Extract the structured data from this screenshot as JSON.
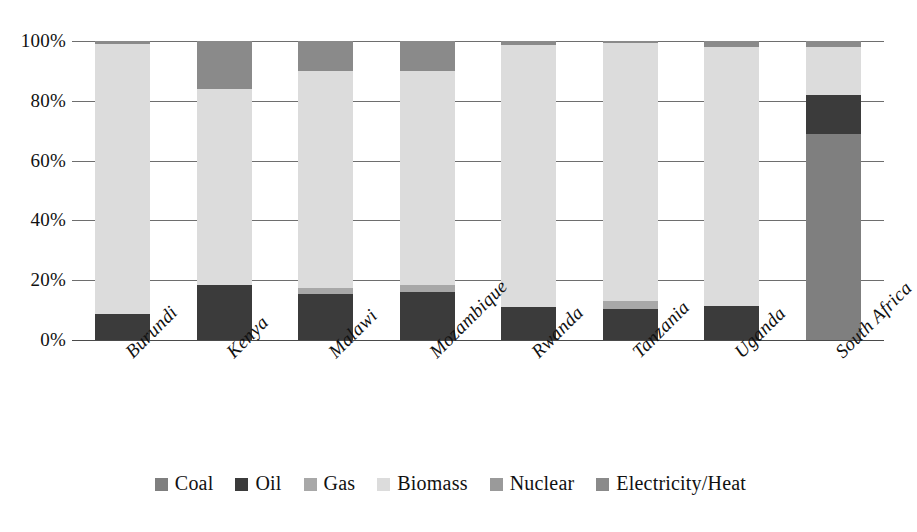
{
  "chart_data": {
    "type": "bar",
    "stacked": true,
    "stack_mode": "percent",
    "title": "",
    "xlabel": "",
    "ylabel": "",
    "ylim": [
      0,
      100
    ],
    "ytick_labels": [
      "0%",
      "20%",
      "40%",
      "60%",
      "80%",
      "100%"
    ],
    "ytick_values": [
      0,
      20,
      40,
      60,
      80,
      100
    ],
    "grid": true,
    "legend_position": "bottom",
    "categories": [
      "Burundi",
      "Kenya",
      "Malawi",
      "Mozambique",
      "Rwanda",
      "Tanzania",
      "Uganda",
      "South Africa"
    ],
    "series": [
      {
        "name": "Coal",
        "color": "#7f7f7f",
        "values": [
          0,
          0,
          0,
          0,
          0,
          0,
          0,
          69
        ]
      },
      {
        "name": "Oil",
        "color": "#3b3b3b",
        "values": [
          8.7,
          18.5,
          15.5,
          16,
          11,
          10.3,
          11.3,
          13
        ]
      },
      {
        "name": "Gas",
        "color": "#a8a8a8",
        "values": [
          0,
          0,
          2,
          2.5,
          0,
          2.7,
          0,
          0
        ]
      },
      {
        "name": "Biomass",
        "color": "#dcdcdc",
        "values": [
          90.3,
          65.5,
          72.5,
          71.5,
          87.7,
          86.3,
          86.7,
          16
        ]
      },
      {
        "name": "Nuclear",
        "color": "#9a9a9a",
        "values": [
          0,
          0,
          0,
          0,
          0,
          0,
          0,
          0
        ]
      },
      {
        "name": "Electricity/Heat",
        "color": "#8a8a8a",
        "values": [
          1.0,
          16.0,
          10.0,
          10.0,
          1.3,
          0.7,
          2.0,
          2.0
        ]
      }
    ]
  },
  "legend": {
    "items": [
      {
        "label": "Coal",
        "color": "#7f7f7f"
      },
      {
        "label": "Oil",
        "color": "#3b3b3b"
      },
      {
        "label": "Gas",
        "color": "#a8a8a8"
      },
      {
        "label": "Biomass",
        "color": "#dcdcdc"
      },
      {
        "label": "Nuclear",
        "color": "#9a9a9a"
      },
      {
        "label": "Electricity/Heat",
        "color": "#8a8a8a"
      }
    ]
  },
  "axes": {
    "y_ticks": [
      "0%",
      "20%",
      "40%",
      "60%",
      "80%",
      "100%"
    ],
    "x_ticks": [
      "Burundi",
      "Kenya",
      "Malawi",
      "Mozambique",
      "Rwanda",
      "Tanzania",
      "Uganda",
      "South Africa"
    ]
  },
  "colors": {
    "gridline": "#6e6e6e",
    "axis": "#4a4a4a",
    "background": "#ffffff",
    "text": "#111111"
  }
}
